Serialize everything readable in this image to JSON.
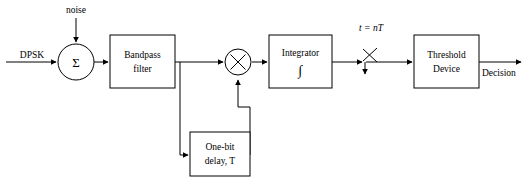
{
  "diagram": {
    "type": "signal-flow-block-diagram",
    "colors": {
      "stroke": "#000000",
      "background": "#ffffff",
      "fill": "#ffffff"
    },
    "signals": {
      "input_label": "DPSK",
      "noise_label": "noise",
      "sample_label": "t = nT",
      "output_label": "Decision"
    },
    "nodes": {
      "summer": {
        "symbol": "Σ",
        "name": "summing-junction"
      },
      "multiplier": {
        "symbol": "×",
        "name": "multiplier-junction"
      },
      "integrator_symbol": "∫"
    },
    "blocks": [
      {
        "id": "bandpass",
        "line1": "Bandpass",
        "line2": "filter"
      },
      {
        "id": "integrator",
        "line1": "Integrator",
        "line2": "∫"
      },
      {
        "id": "delay",
        "line1": "One-bit",
        "line2": "delay, T"
      },
      {
        "id": "threshold",
        "line1": "Threshold",
        "line2": "Device"
      }
    ]
  }
}
